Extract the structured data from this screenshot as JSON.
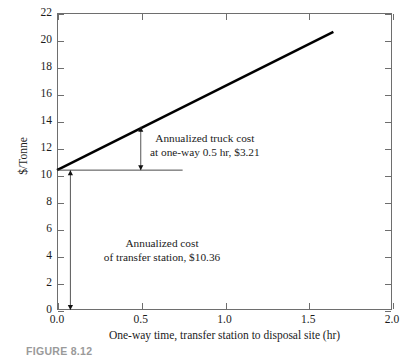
{
  "chart_data": {
    "type": "line",
    "title": "",
    "xlabel": "One-way time, transfer station to disposal site (hr)",
    "ylabel": "$/Tonne",
    "xlim": [
      0.0,
      2.0
    ],
    "ylim": [
      0,
      22
    ],
    "grid": false,
    "legend": null,
    "xticks": [
      "0.0",
      "0.5",
      "1.0",
      "1.5",
      "2.0"
    ],
    "xtick_values": [
      0.0,
      0.5,
      1.0,
      1.5,
      2.0
    ],
    "yticks": [
      "0",
      "2",
      "4",
      "6",
      "8",
      "10",
      "12",
      "14",
      "16",
      "18",
      "20",
      "22"
    ],
    "ytick_values": [
      0,
      2,
      4,
      6,
      8,
      10,
      12,
      14,
      16,
      18,
      20,
      22
    ],
    "series": [
      {
        "name": "Total annualized cost (transfer station + truck haul)",
        "style": "thick-solid-line",
        "x": [
          0.0,
          1.65
        ],
        "values": [
          10.36,
          20.6
        ]
      },
      {
        "name": "Annualized cost of transfer station (reference level)",
        "style": "thin-solid-line",
        "x": [
          0.0,
          0.75
        ],
        "values": [
          10.36,
          10.36
        ]
      }
    ],
    "annotations": [
      {
        "name": "truck-cost-annotation",
        "text_line1": "Annualized truck cost",
        "text_line2": "at one-way 0.5 hr, $3.21",
        "value": 3.21,
        "at_x": 0.5,
        "from_y": 10.36,
        "to_y": 13.57,
        "arrow": "double-headed-vertical"
      },
      {
        "name": "transfer-station-cost-annotation",
        "text_line1": "Annualized cost",
        "text_line2": "of transfer station, $10.36",
        "value": 10.36,
        "at_x": 0.08,
        "from_y": 0,
        "to_y": 10.36,
        "arrow": "double-headed-vertical"
      }
    ]
  },
  "axes": {
    "y_title": "$/Tonne",
    "x_title": "One-way time, transfer station to disposal site (hr)"
  },
  "caption": {
    "text": "FIGURE 8.12"
  },
  "colors": {
    "data_line": "#000000",
    "reference_line": "#4a4a4a",
    "frame": "#6e6e6e",
    "text": "#1b1b1b",
    "background": "#ffffff"
  }
}
